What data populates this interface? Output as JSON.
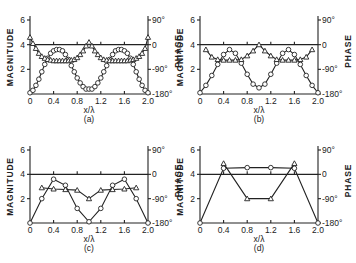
{
  "figure": {
    "colors": {
      "ink": "#222222",
      "background": "#ffffff"
    },
    "left_axis_label": "MAGNITUDE",
    "right_axis_label": "PHASE",
    "x_label": "x/λ",
    "left_ticks": [
      "2",
      "4",
      "6"
    ],
    "right_ticks": [
      "90°",
      "0",
      "-90°",
      "-180°"
    ],
    "x_ticks": [
      "0",
      "0.4",
      "0.8",
      "1.2",
      "1.6",
      "2.0"
    ]
  },
  "chart_data": [
    {
      "type": "line",
      "panel": "(a)",
      "xlabel": "x/λ",
      "ylabel": "MAGNITUDE",
      "y2label": "PHASE",
      "xlim": [
        0,
        2.0
      ],
      "ylim": [
        0,
        6
      ],
      "y2lim": [
        "-180°",
        "90°"
      ],
      "reference_line_y": 4,
      "series": [
        {
          "name": "magnitude",
          "marker": "circle",
          "x": [
            0,
            0.05,
            0.1,
            0.15,
            0.2,
            0.25,
            0.3,
            0.35,
            0.4,
            0.45,
            0.5,
            0.55,
            0.6,
            0.65,
            0.7,
            0.75,
            0.8,
            0.85,
            0.9,
            0.95,
            1.0,
            1.05,
            1.1,
            1.15,
            1.2,
            1.25,
            1.3,
            1.35,
            1.4,
            1.45,
            1.5,
            1.55,
            1.6,
            1.65,
            1.7,
            1.75,
            1.8,
            1.85,
            1.9,
            1.95,
            2.0
          ],
          "y": [
            0.1,
            0.3,
            0.7,
            1.2,
            1.8,
            2.4,
            2.9,
            3.3,
            3.5,
            3.6,
            3.6,
            3.5,
            3.2,
            2.8,
            2.3,
            1.8,
            1.3,
            0.9,
            0.6,
            0.4,
            0.4,
            0.4,
            0.6,
            0.9,
            1.3,
            1.8,
            2.3,
            2.8,
            3.2,
            3.5,
            3.6,
            3.6,
            3.5,
            3.3,
            2.9,
            2.4,
            1.8,
            1.2,
            0.7,
            0.3,
            0.1
          ]
        },
        {
          "name": "phase",
          "marker": "triangle",
          "x": [
            0,
            0.05,
            0.1,
            0.15,
            0.2,
            0.25,
            0.3,
            0.35,
            0.4,
            0.45,
            0.5,
            0.55,
            0.6,
            0.65,
            0.7,
            0.75,
            0.8,
            0.85,
            0.9,
            0.95,
            1.0,
            1.05,
            1.1,
            1.15,
            1.2,
            1.25,
            1.3,
            1.35,
            1.4,
            1.45,
            1.5,
            1.55,
            1.6,
            1.65,
            1.7,
            1.75,
            1.8,
            1.85,
            1.9,
            1.95,
            2.0
          ],
          "y": [
            4.6,
            4.1,
            3.7,
            3.3,
            3.05,
            2.9,
            2.8,
            2.75,
            2.7,
            2.7,
            2.7,
            2.7,
            2.7,
            2.7,
            2.75,
            2.8,
            2.95,
            3.2,
            3.5,
            3.9,
            4.2,
            3.9,
            3.5,
            3.2,
            2.95,
            2.8,
            2.75,
            2.7,
            2.7,
            2.7,
            2.7,
            2.7,
            2.7,
            2.7,
            2.75,
            2.8,
            2.9,
            3.05,
            3.3,
            3.7,
            4.6
          ]
        }
      ]
    },
    {
      "type": "line",
      "panel": "(b)",
      "xlabel": "x/λ",
      "ylabel": "MAGNITUDE",
      "y2label": "PHASE",
      "xlim": [
        0,
        2.0
      ],
      "ylim": [
        0,
        6
      ],
      "y2lim": [
        "-180°",
        "90°"
      ],
      "reference_line_y": 4,
      "series": [
        {
          "name": "magnitude",
          "marker": "circle",
          "x": [
            0,
            0.1,
            0.2,
            0.3,
            0.4,
            0.5,
            0.6,
            0.7,
            0.8,
            0.9,
            1.0,
            1.1,
            1.2,
            1.3,
            1.4,
            1.5,
            1.6,
            1.7,
            1.8,
            1.9,
            2.0
          ],
          "y": [
            0.1,
            0.7,
            1.5,
            2.4,
            3.2,
            3.6,
            3.3,
            2.5,
            1.6,
            0.8,
            0.5,
            0.8,
            1.6,
            2.5,
            3.3,
            3.6,
            3.2,
            2.4,
            1.5,
            0.7,
            0.1
          ]
        },
        {
          "name": "phase",
          "marker": "triangle",
          "x": [
            0.1,
            0.2,
            0.3,
            0.4,
            0.5,
            0.6,
            0.7,
            0.8,
            0.9,
            1.0,
            1.1,
            1.2,
            1.3,
            1.4,
            1.5,
            1.6,
            1.7,
            1.8,
            1.9
          ],
          "y": [
            3.6,
            3.0,
            2.8,
            2.75,
            2.75,
            2.75,
            2.8,
            3.1,
            3.5,
            4.0,
            3.5,
            3.1,
            2.8,
            2.75,
            2.75,
            2.75,
            2.8,
            3.0,
            3.6
          ]
        }
      ]
    },
    {
      "type": "line",
      "panel": "(c)",
      "xlabel": "x/λ",
      "ylabel": "MAGNITUDE",
      "y2label": "PHASE",
      "xlim": [
        0,
        2.0
      ],
      "ylim": [
        0,
        6
      ],
      "y2lim": [
        "-180°",
        "90°"
      ],
      "reference_line_y": 4,
      "series": [
        {
          "name": "magnitude",
          "marker": "circle",
          "x": [
            0,
            0.2,
            0.4,
            0.6,
            0.8,
            1.0,
            1.2,
            1.4,
            1.6,
            1.8,
            2.0
          ],
          "y": [
            0,
            2.0,
            3.6,
            3.1,
            1.2,
            0.1,
            1.2,
            3.1,
            3.6,
            2.0,
            0
          ]
        },
        {
          "name": "phase",
          "marker": "triangle",
          "x": [
            0.2,
            0.4,
            0.6,
            0.8,
            1.0,
            1.2,
            1.4,
            1.6,
            1.8
          ],
          "y": [
            2.9,
            2.8,
            2.75,
            2.7,
            2.0,
            2.7,
            2.75,
            2.8,
            2.9
          ]
        }
      ]
    },
    {
      "type": "line",
      "panel": "(d)",
      "xlabel": "x/λ",
      "ylabel": "MAGNITUDE",
      "y2label": "PHASE",
      "xlim": [
        0,
        2.0
      ],
      "ylim": [
        0,
        6
      ],
      "y2lim": [
        "-180°",
        "90°"
      ],
      "reference_line_y": 4,
      "series": [
        {
          "name": "magnitude",
          "marker": "circle",
          "x": [
            0,
            0.4,
            0.8,
            1.2,
            1.6,
            2.0
          ],
          "y": [
            0,
            4.5,
            4.55,
            4.55,
            4.5,
            0
          ]
        },
        {
          "name": "phase",
          "marker": "triangle",
          "x": [
            0.4,
            0.8,
            1.2,
            1.6
          ],
          "y": [
            4.9,
            2.0,
            2.0,
            4.9
          ]
        }
      ]
    }
  ]
}
